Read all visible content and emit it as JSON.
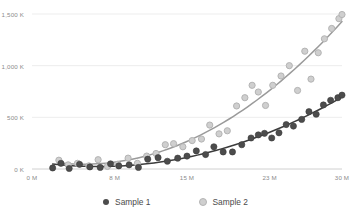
{
  "chart_data": {
    "type": "scatter",
    "title": "",
    "subtitle": "",
    "xlabel": "",
    "ylabel": "",
    "xlim": [
      0,
      30
    ],
    "ylim": [
      0,
      1500
    ],
    "grid": true,
    "legend_position": "bottom",
    "x_tick_labels": [
      "0 M",
      "8 M",
      "15 M",
      "23 M",
      "30 M"
    ],
    "x_tick_values": [
      0,
      8,
      15,
      23,
      30
    ],
    "y_tick_labels": [
      "0 K",
      "500 K",
      "1,000 K",
      "1,500 K"
    ],
    "y_tick_values": [
      0,
      500,
      1000,
      1500
    ],
    "x_unit": "M",
    "y_unit": "K",
    "series": [
      {
        "name": "Sample 1",
        "color": "#4c4c4c",
        "marker": "filled-circle",
        "has_trendline": true,
        "trendline_color": "#3c3c3c",
        "points": [
          [
            2.0,
            10
          ],
          [
            2.8,
            55
          ],
          [
            3.6,
            5
          ],
          [
            4.6,
            45
          ],
          [
            5.6,
            20
          ],
          [
            6.6,
            15
          ],
          [
            7.6,
            50
          ],
          [
            8.4,
            30
          ],
          [
            9.4,
            40
          ],
          [
            10.3,
            15
          ],
          [
            11.2,
            95
          ],
          [
            12.2,
            110
          ],
          [
            13.1,
            75
          ],
          [
            14.1,
            105
          ],
          [
            15.0,
            125
          ],
          [
            15.9,
            175
          ],
          [
            16.8,
            140
          ],
          [
            17.6,
            215
          ],
          [
            18.5,
            165
          ],
          [
            19.4,
            165
          ],
          [
            20.3,
            235
          ],
          [
            21.2,
            300
          ],
          [
            21.9,
            330
          ],
          [
            22.5,
            345
          ],
          [
            23.2,
            300
          ],
          [
            23.9,
            350
          ],
          [
            24.6,
            430
          ],
          [
            25.3,
            415
          ],
          [
            26.1,
            480
          ],
          [
            26.8,
            555
          ],
          [
            27.5,
            530
          ],
          [
            28.2,
            620
          ],
          [
            28.9,
            665
          ],
          [
            29.6,
            690
          ],
          [
            30.0,
            715
          ]
        ]
      },
      {
        "name": "Sample 2",
        "color": "#cfcfcf",
        "marker": "open-circle",
        "has_trendline": true,
        "trendline_color": "#9a9a9a",
        "points": [
          [
            2.6,
            85
          ],
          [
            3.5,
            40
          ],
          [
            4.4,
            55
          ],
          [
            5.5,
            30
          ],
          [
            6.4,
            90
          ],
          [
            7.3,
            25
          ],
          [
            8.3,
            45
          ],
          [
            9.3,
            105
          ],
          [
            10.2,
            55
          ],
          [
            11.1,
            125
          ],
          [
            12.0,
            150
          ],
          [
            12.9,
            235
          ],
          [
            13.7,
            245
          ],
          [
            14.6,
            215
          ],
          [
            15.5,
            275
          ],
          [
            16.4,
            290
          ],
          [
            17.2,
            425
          ],
          [
            18.1,
            340
          ],
          [
            18.9,
            370
          ],
          [
            19.8,
            610
          ],
          [
            20.6,
            690
          ],
          [
            21.3,
            810
          ],
          [
            21.9,
            745
          ],
          [
            22.6,
            615
          ],
          [
            23.3,
            810
          ],
          [
            24.1,
            900
          ],
          [
            24.9,
            1000
          ],
          [
            25.7,
            760
          ],
          [
            26.4,
            1140
          ],
          [
            27.0,
            870
          ],
          [
            27.7,
            1125
          ],
          [
            28.3,
            1260
          ],
          [
            29.0,
            1360
          ],
          [
            29.7,
            1455
          ],
          [
            30.0,
            1495
          ]
        ]
      }
    ]
  },
  "legend": {
    "items": [
      {
        "label": "Sample 1",
        "color": "#4c4c4c",
        "marker": "filled-circle"
      },
      {
        "label": "Sample 2",
        "color": "#cfcfcf",
        "marker": "open-circle"
      }
    ]
  },
  "colors": {
    "series_1": "#4c4c4c",
    "series_2": "#cfcfcf",
    "trendline_1": "#3c3c3c",
    "trendline_2": "#9a9a9a",
    "gridline": "#ededed",
    "axis_line": "#d0d0d0",
    "tick_text": "#8b8b8b",
    "legend_text": "#4a4a4a",
    "background": "#ffffff"
  }
}
